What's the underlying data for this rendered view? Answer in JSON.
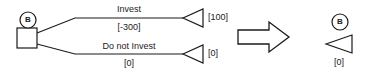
{
  "diagram": {
    "type": "decision-tree-reduction",
    "left_tree": {
      "decision_node": {
        "label": "B",
        "shape": "square"
      },
      "branches": [
        {
          "name": "invest-branch",
          "label": "Invest",
          "payoff": "[-300]",
          "terminal_value": "[100]",
          "terminal_shape": "triangle"
        },
        {
          "name": "do-not-invest-branch",
          "label": "Do not Invest",
          "payoff": "[0]",
          "terminal_value": "[0]",
          "terminal_shape": "triangle"
        }
      ]
    },
    "transform_arrow": {
      "name": "implies-arrow",
      "direction": "right"
    },
    "right_tree": {
      "node_label": "B",
      "terminal_shape": "triangle",
      "terminal_value": "[0]"
    },
    "colors": {
      "stroke": "#1a1a1a",
      "fill": "#ffffff",
      "background": "#ffffff"
    }
  }
}
